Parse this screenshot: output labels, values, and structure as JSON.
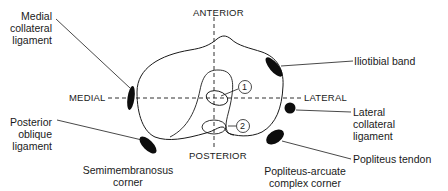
{
  "diagram": {
    "axes": {
      "anterior": "ANTERIOR",
      "posterior": "POSTERIOR",
      "medial": "MEDIAL",
      "lateral": "LATERAL"
    },
    "markers": {
      "one": "1",
      "two": "2"
    },
    "labels": {
      "mcl": [
        "Medial",
        "collateral",
        "ligament"
      ],
      "pol": [
        "Posterior",
        "oblique",
        "ligament"
      ],
      "itb": "Iliotibial band",
      "lcl": [
        "Lateral",
        "collateral",
        "ligament"
      ],
      "popliteus": "Popliteus tendon",
      "semimembranosus_corner": [
        "Semimembranosus",
        "corner"
      ],
      "popliteus_corner": [
        "Popliteus-arcuate",
        "complex corner"
      ]
    },
    "colors": {
      "stroke": "#1a1a1a",
      "fill": "#0d0d0d",
      "background": "#ffffff"
    }
  }
}
